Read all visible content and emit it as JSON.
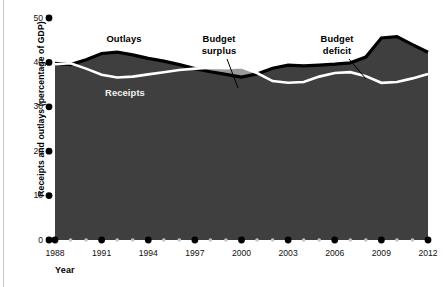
{
  "chart_data": {
    "type": "area",
    "title": "",
    "xlabel": "Year",
    "ylabel": "Receipts and outlays (percentage of GDP)",
    "xlim": [
      1988,
      2012
    ],
    "ylim": [
      0,
      50
    ],
    "grid": false,
    "legend_position": "inline-annotations",
    "xticks": [
      1988,
      1991,
      1994,
      1997,
      2000,
      2003,
      2006,
      2009,
      2012
    ],
    "xtick_labels": [
      "1988",
      "1991",
      "1994",
      "1997",
      "2000",
      "2003",
      "2006",
      "2009",
      "2012"
    ],
    "xminor_ticks": [
      1989,
      1990,
      1992,
      1993,
      1995,
      1996,
      1998,
      1999,
      2001,
      2002,
      2004,
      2005,
      2007,
      2008,
      2010,
      2011
    ],
    "yticks": [
      0,
      10,
      20,
      30,
      40,
      50
    ],
    "ytick_labels": [
      "0",
      "10",
      "20",
      "30",
      "40",
      "50"
    ],
    "x": [
      1988,
      1989,
      1990,
      1991,
      1992,
      1993,
      1994,
      1995,
      1996,
      1997,
      1998,
      1999,
      2000,
      2001,
      2002,
      2003,
      2004,
      2005,
      2006,
      2007,
      2008,
      2009,
      2010,
      2011,
      2012
    ],
    "series": [
      {
        "name": "Outlays",
        "color": "#3f3f3f",
        "stroke": "#000000",
        "values": [
          39.8,
          39.5,
          40.6,
          42.0,
          42.3,
          41.7,
          40.9,
          40.3,
          39.5,
          38.6,
          37.9,
          37.3,
          36.7,
          37.4,
          38.7,
          39.4,
          39.2,
          39.4,
          39.6,
          39.9,
          41.2,
          45.5,
          45.8,
          44.0,
          42.3
        ]
      },
      {
        "name": "Receipts",
        "color": "#9a9a9a",
        "stroke": "#ffffff",
        "values": [
          39.6,
          39.8,
          38.6,
          37.2,
          36.6,
          36.8,
          37.3,
          37.8,
          38.3,
          38.6,
          38.8,
          38.7,
          38.9,
          37.6,
          35.8,
          35.4,
          35.6,
          36.8,
          37.6,
          37.8,
          36.9,
          35.4,
          35.6,
          36.4,
          37.4
        ]
      }
    ],
    "annotations": [
      {
        "text": "Outlays",
        "style": "dark",
        "x": 124,
        "y": 42
      },
      {
        "text": "Receipts",
        "style": "light",
        "x": 125,
        "y": 96
      },
      {
        "text": "Budget",
        "style": "dark",
        "x": 219,
        "y": 42
      },
      {
        "text": "surplus",
        "style": "dark",
        "x": 219,
        "y": 54
      },
      {
        "text": "Budget",
        "style": "dark",
        "x": 337,
        "y": 42
      },
      {
        "text": "deficit",
        "style": "dark",
        "x": 337,
        "y": 54
      }
    ],
    "leader_lines": [
      {
        "name": "surplus-leader",
        "x1": 227,
        "y1": 59,
        "x2": 238,
        "y2": 88
      },
      {
        "name": "deficit-leader",
        "x1": 349,
        "y1": 59,
        "x2": 366,
        "y2": 79
      }
    ]
  }
}
